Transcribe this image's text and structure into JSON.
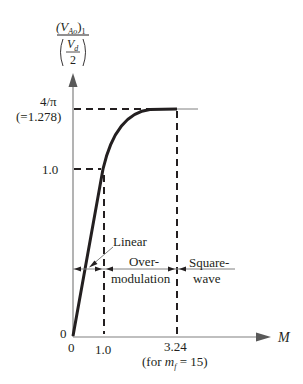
{
  "y_axis": {
    "label_numerator": "(V",
    "label_numerator_sub": "Ao",
    "label_numerator_close": ")",
    "label_numerator_index": "1",
    "label_denominator_top": "V",
    "label_denominator_sub": "d",
    "label_denominator_bottom": "2",
    "ticks": [
      {
        "label": "4/π",
        "sublabel": "(=1.278)",
        "value": 1.278
      },
      {
        "label": "1.0",
        "value": 1.0
      },
      {
        "label": "0",
        "value": 0
      }
    ]
  },
  "x_axis": {
    "label": "M",
    "ticks": [
      {
        "label": "0",
        "value": 0
      },
      {
        "label": "1.0",
        "value": 1.0
      },
      {
        "label": "3.24",
        "value": 3.24,
        "note_prefix": "(for ",
        "note_var": "m",
        "note_sub": "f",
        "note_suffix": " = 15)"
      }
    ]
  },
  "regions": {
    "linear": "Linear",
    "overmodulation_line1": "Over-",
    "overmodulation_line2": "modulation",
    "squarewave_line1": "Square-",
    "squarewave_line2": "wave"
  },
  "colors": {
    "axis": "#808080",
    "curve": "#231f20",
    "text": "#231f20"
  }
}
